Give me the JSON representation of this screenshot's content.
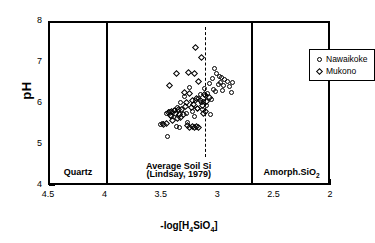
{
  "chart_data": {
    "type": "scatter",
    "title": "",
    "xlabel": "-log[H4SiO4]",
    "xlabel_html": "-log[H<sub>4</sub>SiO<sub>4</sub>]",
    "ylabel": "pH",
    "xlim": [
      4.5,
      2.0
    ],
    "x_reversed": true,
    "ylim": [
      4,
      8
    ],
    "grid": false,
    "legend_position": "top-right",
    "xticks": [
      4.5,
      4,
      3.5,
      3,
      2.5,
      2
    ],
    "xtick_labels": [
      "4.5",
      "4",
      "3.5",
      "3",
      "2.5",
      "2"
    ],
    "x_minor_interval": 0.1,
    "yticks": [
      4,
      5,
      6,
      7,
      8
    ],
    "ytick_labels": [
      "4",
      "5",
      "6",
      "7",
      "8"
    ],
    "y_minor_interval": 0.1,
    "series": [
      {
        "name": "Nawaikoke",
        "marker": "circle",
        "points": [
          [
            3.04,
            6.9
          ],
          [
            3.02,
            6.78
          ],
          [
            3.0,
            6.7
          ],
          [
            2.98,
            6.66
          ],
          [
            3.06,
            6.64
          ],
          [
            2.95,
            6.62
          ],
          [
            2.93,
            6.58
          ],
          [
            2.99,
            6.56
          ],
          [
            2.88,
            6.55
          ],
          [
            3.09,
            6.53
          ],
          [
            3.01,
            6.5
          ],
          [
            2.96,
            6.47
          ],
          [
            2.91,
            6.44
          ],
          [
            3.13,
            6.41
          ],
          [
            3.05,
            6.38
          ],
          [
            2.97,
            6.35
          ],
          [
            3.03,
            6.33
          ],
          [
            2.89,
            6.3
          ],
          [
            3.1,
            6.28
          ],
          [
            3.17,
            6.25
          ],
          [
            3.12,
            6.22
          ],
          [
            3.18,
            6.17
          ],
          [
            3.07,
            6.14
          ],
          [
            3.21,
            6.12
          ],
          [
            3.14,
            6.08
          ],
          [
            3.16,
            6.05
          ],
          [
            3.11,
            5.98
          ],
          [
            3.19,
            5.92
          ],
          [
            3.15,
            5.88
          ],
          [
            3.24,
            5.83
          ],
          [
            3.29,
            5.8
          ],
          [
            3.08,
            5.76
          ],
          [
            3.22,
            5.73
          ],
          [
            3.34,
            6.06
          ],
          [
            3.37,
            5.93
          ],
          [
            3.4,
            5.86
          ],
          [
            3.44,
            5.84
          ],
          [
            3.47,
            5.79
          ],
          [
            3.42,
            5.72
          ],
          [
            3.5,
            5.55
          ],
          [
            3.52,
            5.52
          ],
          [
            3.38,
            5.48
          ],
          [
            3.35,
            5.45
          ],
          [
            3.46,
            5.24
          ],
          [
            3.26,
            6.43
          ],
          [
            3.31,
            6.21
          ],
          [
            3.28,
            5.58
          ]
        ]
      },
      {
        "name": "Mukono",
        "marker": "diamond",
        "points": [
          [
            3.21,
            7.4
          ],
          [
            3.16,
            7.15
          ],
          [
            3.27,
            6.8
          ],
          [
            3.22,
            6.76
          ],
          [
            3.18,
            6.58
          ],
          [
            3.38,
            6.78
          ],
          [
            3.44,
            6.48
          ],
          [
            3.31,
            6.3
          ],
          [
            3.26,
            6.28
          ],
          [
            3.13,
            6.26
          ],
          [
            3.2,
            6.16
          ],
          [
            3.24,
            6.12
          ],
          [
            3.17,
            6.1
          ],
          [
            3.11,
            6.08
          ],
          [
            3.29,
            6.05
          ],
          [
            3.23,
            6.02
          ],
          [
            3.33,
            5.9
          ],
          [
            3.36,
            5.88
          ],
          [
            3.4,
            5.86
          ],
          [
            3.42,
            5.84
          ],
          [
            3.45,
            5.82
          ],
          [
            3.39,
            5.8
          ],
          [
            3.35,
            5.78
          ],
          [
            3.32,
            5.76
          ],
          [
            3.43,
            5.74
          ],
          [
            3.3,
            5.97
          ],
          [
            3.25,
            5.94
          ],
          [
            3.09,
            6.19
          ],
          [
            3.15,
            6.0
          ],
          [
            3.19,
            5.91
          ],
          [
            3.47,
            5.54
          ],
          [
            3.49,
            5.53
          ],
          [
            3.28,
            5.5
          ],
          [
            3.24,
            5.48
          ],
          [
            3.26,
            5.46
          ],
          [
            3.22,
            5.44
          ],
          [
            3.2,
            5.47
          ],
          [
            3.18,
            5.45
          ],
          [
            3.34,
            5.7
          ],
          [
            3.37,
            5.66
          ],
          [
            3.41,
            5.61
          ],
          [
            3.12,
            5.84
          ],
          [
            3.14,
            5.79
          ]
        ]
      }
    ],
    "reference_lines": [
      {
        "name": "quartz-boundary",
        "x": 4.0,
        "style": "solid"
      },
      {
        "name": "average-soil-si-line",
        "x": 3.13,
        "style": "dashed"
      },
      {
        "name": "amorphous-silica-boundary",
        "x": 2.72,
        "style": "solid"
      }
    ],
    "annotations": [
      {
        "name": "quartz-region-label",
        "text": "Quartz",
        "x": 4.25,
        "y": 4.35
      },
      {
        "name": "average-soil-si-label-line1",
        "text": "Average Soil Si",
        "x": 3.36,
        "y": 4.5
      },
      {
        "name": "average-soil-si-label-line2",
        "text": "(Lindsay, 1979)",
        "x": 3.36,
        "y": 4.3
      },
      {
        "name": "amorphous-silica-region-label",
        "text": "Amorph.SiO2",
        "text_html": "Amorph.SiO<sub>2</sub>",
        "x": 2.36,
        "y": 4.35
      }
    ]
  },
  "legend": {
    "entries": [
      {
        "label": "Nawaikoke",
        "marker": "circle"
      },
      {
        "label": "Mukono",
        "marker": "diamond"
      }
    ]
  },
  "colors": {
    "axis": "#000000",
    "marker": "#000000",
    "background": "#ffffff"
  }
}
